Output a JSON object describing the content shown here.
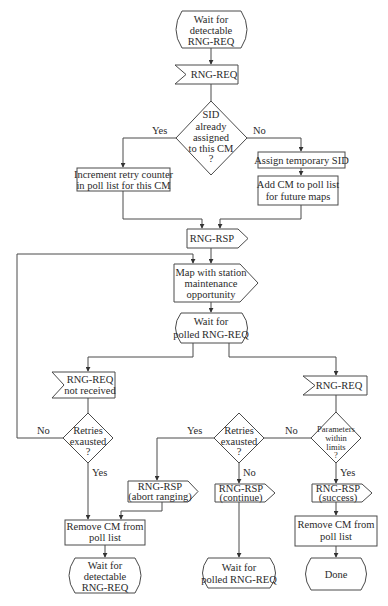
{
  "diagram": {
    "nodes": {
      "start": {
        "lines": [
          "Wait for",
          "detectable",
          "RNG-REQ"
        ],
        "type": "terminator"
      },
      "rng_req_in": {
        "lines": [
          "RNG-REQ"
        ],
        "type": "receive"
      },
      "sid_check": {
        "lines": [
          "SID",
          "already",
          "assigned",
          "to this CM",
          "?"
        ],
        "type": "decision"
      },
      "increment": {
        "lines": [
          "Increment retry counter",
          "in poll list for this CM"
        ],
        "type": "process"
      },
      "assign_sid": {
        "lines": [
          "Assign temporary SID"
        ],
        "type": "process"
      },
      "add_cm": {
        "lines": [
          "Add CM to poll list",
          "for future maps"
        ],
        "type": "process"
      },
      "rng_rsp": {
        "lines": [
          "RNG-RSP"
        ],
        "type": "send"
      },
      "map": {
        "lines": [
          "Map with station",
          "maintenance",
          "opportunity"
        ],
        "type": "send"
      },
      "wait_polled": {
        "lines": [
          "Wait for",
          "polled RNG-REQ"
        ],
        "type": "terminator"
      },
      "not_received": {
        "lines": [
          "RNG-REQ",
          "not received"
        ],
        "type": "receive"
      },
      "retries_left": {
        "lines": [
          "Retries",
          "exausted",
          "?"
        ],
        "type": "decision"
      },
      "rng_req_right": {
        "lines": [
          "RNG-REQ"
        ],
        "type": "receive"
      },
      "retries_mid": {
        "lines": [
          "Retries",
          "exausted",
          "?"
        ],
        "type": "decision"
      },
      "params": {
        "lines": [
          "Parameters",
          "within",
          "limits",
          "?"
        ],
        "type": "decision"
      },
      "rsp_abort": {
        "lines": [
          "RNG-RSP",
          "(abort ranging)"
        ],
        "type": "send"
      },
      "rsp_continue": {
        "lines": [
          "RNG-RSP",
          "(continue)"
        ],
        "type": "send"
      },
      "rsp_success": {
        "lines": [
          "RNG-RSP",
          "(success)"
        ],
        "type": "send"
      },
      "remove_left": {
        "lines": [
          "Remove CM from",
          "poll list"
        ],
        "type": "process"
      },
      "remove_right": {
        "lines": [
          "Remove CM from",
          "poll list"
        ],
        "type": "process"
      },
      "end_detectable": {
        "lines": [
          "Wait for",
          "detectable",
          "RNG-REQ"
        ],
        "type": "terminator"
      },
      "end_polled": {
        "lines": [
          "Wait for",
          "polled RNG-REQ"
        ],
        "type": "terminator"
      },
      "done": {
        "lines": [
          "Done"
        ],
        "type": "terminator"
      }
    },
    "edge_labels": {
      "sid_yes": "Yes",
      "sid_no": "No",
      "left_no": "No",
      "left_yes": "Yes",
      "mid_yes": "Yes",
      "mid_no": "No",
      "params_no": "No",
      "params_yes": "Yes"
    },
    "colors": {
      "stroke": "#4a4a4a",
      "text": "#2a2a2a",
      "background": "#ffffff"
    }
  }
}
